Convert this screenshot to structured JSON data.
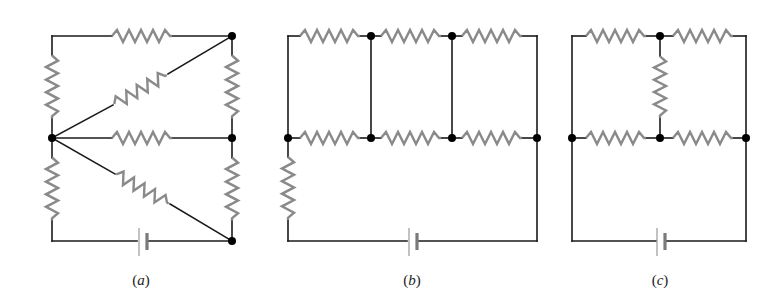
{
  "figure": {
    "colors": {
      "wire": "#1a1a1a",
      "resistor": "#8a8a8a",
      "node": "#000000",
      "background": "#ffffff"
    },
    "panels": [
      {
        "id": "a",
        "label": "(a)",
        "label_letter": "a",
        "resistor_count": 8,
        "node_count": 4,
        "battery_count": 1
      },
      {
        "id": "b",
        "label": "(b)",
        "label_letter": "b",
        "resistor_count": 7,
        "node_count": 6,
        "battery_count": 1
      },
      {
        "id": "c",
        "label": "(c)",
        "label_letter": "c",
        "resistor_count": 5,
        "node_count": 4,
        "battery_count": 1
      }
    ]
  }
}
